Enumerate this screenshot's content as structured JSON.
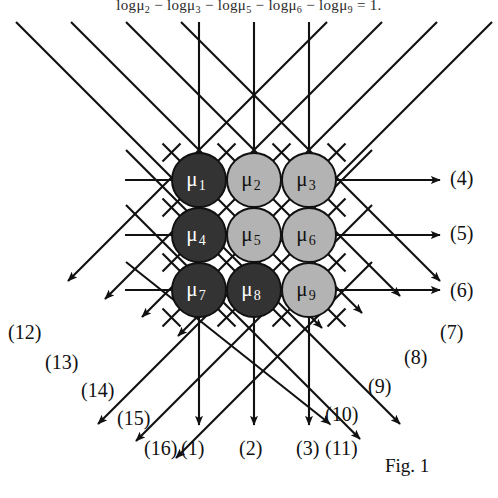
{
  "figure": {
    "caption": "Fig. 1",
    "equation_top": "logμ₂ − logμ₃ − logμ₅ − logμ₆ − logμ₉ = 1.",
    "background_color": "#ffffff",
    "line_color": "#111111",
    "dark_node_color": "#333333",
    "light_node_color": "#b3b3b3",
    "dark_node_text_color": "#ffffff",
    "light_node_text_color": "#111111",
    "node_stroke_color": "#111111"
  },
  "nodes": [
    {
      "id": "mu1",
      "base": "μ",
      "sub": "1",
      "shade": "dark",
      "cx": 199,
      "cy": 180,
      "r": 27,
      "row": 1,
      "col": 1
    },
    {
      "id": "mu2",
      "base": "μ",
      "sub": "2",
      "shade": "light",
      "cx": 254,
      "cy": 180,
      "r": 27,
      "row": 1,
      "col": 2
    },
    {
      "id": "mu3",
      "base": "μ",
      "sub": "3",
      "shade": "light",
      "cx": 309,
      "cy": 180,
      "r": 27,
      "row": 1,
      "col": 3
    },
    {
      "id": "mu4",
      "base": "μ",
      "sub": "4",
      "shade": "dark",
      "cx": 199,
      "cy": 235,
      "r": 27,
      "row": 2,
      "col": 1
    },
    {
      "id": "mu5",
      "base": "μ",
      "sub": "5",
      "shade": "light",
      "cx": 254,
      "cy": 235,
      "r": 27,
      "row": 2,
      "col": 2
    },
    {
      "id": "mu6",
      "base": "μ",
      "sub": "6",
      "shade": "light",
      "cx": 309,
      "cy": 235,
      "r": 27,
      "row": 2,
      "col": 3
    },
    {
      "id": "mu7",
      "base": "μ",
      "sub": "7",
      "shade": "dark",
      "cx": 199,
      "cy": 290,
      "r": 27,
      "row": 3,
      "col": 1
    },
    {
      "id": "mu8",
      "base": "μ",
      "sub": "8",
      "shade": "dark",
      "cx": 254,
      "cy": 290,
      "r": 27,
      "row": 3,
      "col": 2
    },
    {
      "id": "mu9",
      "base": "μ",
      "sub": "9",
      "shade": "light",
      "cx": 309,
      "cy": 290,
      "r": 27,
      "row": 3,
      "col": 3
    }
  ],
  "port_labels": [
    {
      "id": "p1",
      "text": "(1)",
      "x": 181,
      "y": 438
    },
    {
      "id": "p2",
      "text": "(2)",
      "x": 239,
      "y": 438
    },
    {
      "id": "p3",
      "text": "(3)",
      "x": 296,
      "y": 438
    },
    {
      "id": "p4",
      "text": "(4)",
      "x": 450,
      "y": 168
    },
    {
      "id": "p5",
      "text": "(5)",
      "x": 450,
      "y": 223
    },
    {
      "id": "p6",
      "text": "(6)",
      "x": 450,
      "y": 280
    },
    {
      "id": "p7",
      "text": "(7)",
      "x": 440,
      "y": 322
    },
    {
      "id": "p8",
      "text": "(8)",
      "x": 404,
      "y": 347
    },
    {
      "id": "p9",
      "text": "(9)",
      "x": 368,
      "y": 376
    },
    {
      "id": "p10",
      "text": "(10)",
      "x": 325,
      "y": 404
    },
    {
      "id": "p11",
      "text": "(11)",
      "x": 325,
      "y": 438
    },
    {
      "id": "p12",
      "text": "(12)",
      "x": 8,
      "y": 322
    },
    {
      "id": "p13",
      "text": "(13)",
      "x": 45,
      "y": 352
    },
    {
      "id": "p14",
      "text": "(14)",
      "x": 81,
      "y": 380
    },
    {
      "id": "p15",
      "text": "(15)",
      "x": 117,
      "y": 408
    },
    {
      "id": "p16",
      "text": "(16)",
      "x": 144,
      "y": 438
    }
  ],
  "geometry": {
    "rows_y": [
      180,
      235,
      290
    ],
    "cols_x": [
      199,
      254,
      309
    ],
    "left_line_start_x": 125,
    "right_arrow_tip_x": 440,
    "vertical_arrow_tip_y": 425,
    "vertical_line_top_y": 22,
    "arrow_head_size": 9
  }
}
